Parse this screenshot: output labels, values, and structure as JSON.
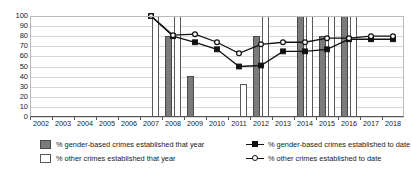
{
  "chart_data": {
    "type": "bar",
    "title": "",
    "xlabel": "",
    "ylabel": "",
    "ylim": [
      0,
      100
    ],
    "ytick_step": 10,
    "grid": true,
    "legend_position": "bottom",
    "categories": [
      "2002",
      "2003",
      "2004",
      "2005",
      "2006",
      "2007",
      "2008",
      "2009",
      "2010",
      "2011",
      "2012",
      "2013",
      "2014",
      "2015",
      "2016",
      "2017",
      "2018"
    ],
    "yticks": [
      "100",
      "90",
      "80",
      "70",
      "60",
      "50",
      "40",
      "30",
      "20",
      "10",
      "0"
    ],
    "series": [
      {
        "name": "% gender-based crimes established that year",
        "kind": "bar",
        "color": "#7b7b7b",
        "values": [
          null,
          null,
          null,
          null,
          null,
          null,
          80,
          41,
          null,
          null,
          80,
          null,
          100,
          80,
          100,
          null,
          null
        ]
      },
      {
        "name": "% other crimes established that year",
        "kind": "bar",
        "color": "#ffffff",
        "values": [
          null,
          null,
          null,
          null,
          null,
          100,
          100,
          null,
          null,
          33,
          100,
          null,
          100,
          100,
          100,
          null,
          null
        ]
      },
      {
        "name": "% gender-based crimes established to date",
        "kind": "line",
        "marker": "filled-square",
        "color": "#111111",
        "values": [
          null,
          null,
          null,
          null,
          null,
          100,
          80,
          74,
          67,
          50,
          51,
          65,
          65,
          67,
          77,
          77,
          77
        ]
      },
      {
        "name": "% other crimes established to date",
        "kind": "line",
        "marker": "open-circle",
        "color": "#111111",
        "values": [
          null,
          null,
          null,
          null,
          null,
          100,
          81,
          82,
          74,
          63,
          72,
          74,
          74,
          78,
          78,
          80,
          80
        ]
      }
    ]
  },
  "legend": {
    "items": [
      {
        "label": "% gender-based crimes established that year",
        "marker": "bar-gender"
      },
      {
        "label": "% other crimes established that year",
        "marker": "bar-other"
      },
      {
        "label": "% gender-based crimes established to date",
        "marker": "line-filled-square"
      },
      {
        "label": "% other crimes established to date",
        "marker": "line-open-circle"
      }
    ]
  }
}
